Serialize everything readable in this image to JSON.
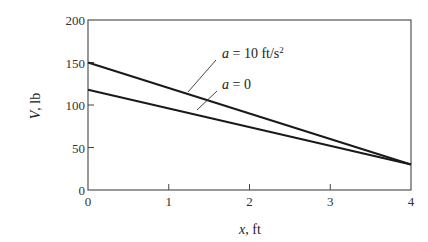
{
  "chart_data": {
    "type": "line",
    "title": "",
    "xlabel": "x, ft",
    "xlabel_var": "x",
    "xlabel_unit": ", ft",
    "ylabel": "V, lb",
    "ylabel_var": "V",
    "ylabel_unit": ", lb",
    "xlim": [
      0,
      4
    ],
    "ylim": [
      0,
      200
    ],
    "xticks": [
      0,
      1,
      2,
      3,
      4
    ],
    "yticks": [
      0,
      50,
      100,
      150,
      200
    ],
    "grid": false,
    "legend": "annotations",
    "series": [
      {
        "name": "a = 10 ft/s²",
        "label_var": "a",
        "label_rest": " = 10 ft/s",
        "label_sup": "2",
        "x": [
          0,
          4
        ],
        "values": [
          150,
          30
        ]
      },
      {
        "name": "a = 0",
        "label_var": "a",
        "label_rest": " = 0",
        "label_sup": "",
        "x": [
          0,
          4
        ],
        "values": [
          118,
          30
        ]
      }
    ]
  },
  "style": {
    "line_color": "#1a1a1a",
    "axis_color": "#444444",
    "background": "#ffffff"
  }
}
